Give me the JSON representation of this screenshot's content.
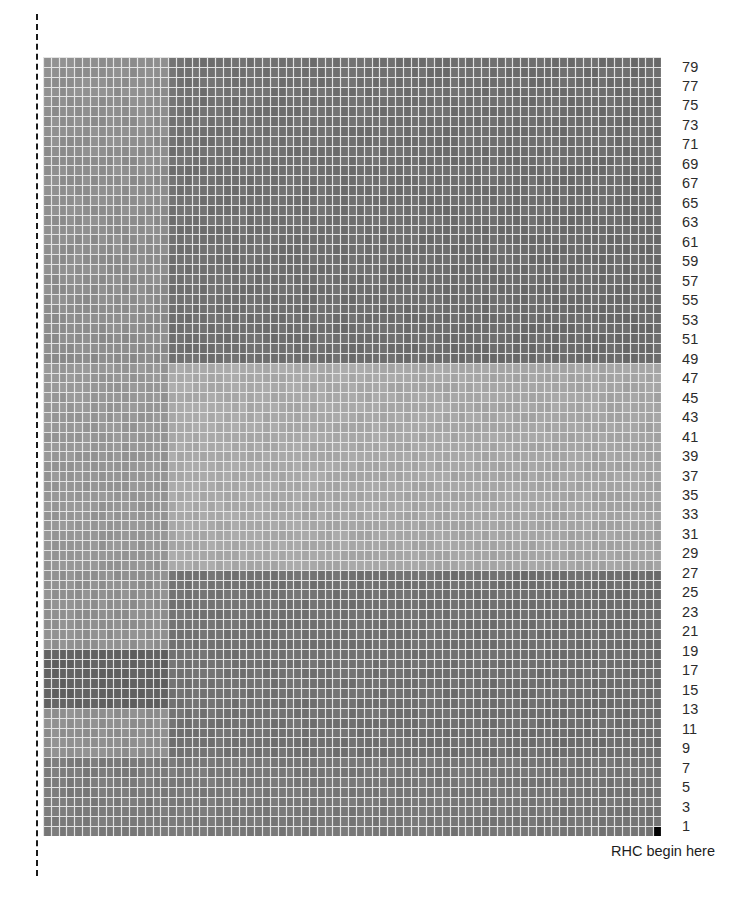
{
  "figure": {
    "title": "",
    "caption_label": "RHC begin here",
    "dashed_guide_name": "left-margin-dashed-line"
  },
  "axis": {
    "position": "right",
    "orientation": "bottom-to-top",
    "tick_labels": [
      "79",
      "77",
      "75",
      "73",
      "71",
      "69",
      "67",
      "65",
      "63",
      "61",
      "59",
      "57",
      "55",
      "53",
      "51",
      "49",
      "47",
      "45",
      "43",
      "41",
      "39",
      "37",
      "35",
      "33",
      "31",
      "29",
      "27",
      "25",
      "23",
      "21",
      "19",
      "17",
      "15",
      "13",
      "11",
      "9",
      "7",
      "5",
      "3",
      "1"
    ]
  },
  "colors": {
    "background": "#ffffff",
    "grid_line": "#e8e8e8",
    "cell_dark": "#4a4a4a",
    "cell_mid": "#565656",
    "cell_light": "#6e6e6e",
    "cell_lightest": "#7a7a7a",
    "cell_black": "#0d0d0d",
    "label_text": "#2b2b2b",
    "dashed_line": "#1a1a1a"
  },
  "chart_data": {
    "type": "heatmap",
    "title": "",
    "xlabel": "",
    "ylabel": "",
    "grid": true,
    "legend": null,
    "rows": 79,
    "cols": 79,
    "row_labels_shown": [
      "79",
      "77",
      "75",
      "73",
      "71",
      "69",
      "67",
      "65",
      "63",
      "61",
      "59",
      "57",
      "55",
      "53",
      "51",
      "49",
      "47",
      "45",
      "43",
      "41",
      "39",
      "37",
      "35",
      "33",
      "31",
      "29",
      "27",
      "25",
      "23",
      "21",
      "19",
      "17",
      "15",
      "13",
      "11",
      "9",
      "7",
      "5",
      "3",
      "1"
    ],
    "col_labels_shown": [],
    "value_range": [
      0.0,
      1.0
    ],
    "colormap": "grayscale",
    "annotations": [
      {
        "text": "RHC begin here",
        "x_frac": 0.97,
        "y_frac": 1.01
      }
    ],
    "regions": [
      {
        "name": "upper-left-block",
        "row_start": 48,
        "row_end": 79,
        "col_start": 0,
        "col_end": 16,
        "value": 0.56
      },
      {
        "name": "upper-right-block",
        "row_start": 48,
        "row_end": 79,
        "col_start": 16,
        "col_end": 79,
        "value": 0.45
      },
      {
        "name": "mid-left-light-patch",
        "row_start": 41,
        "row_end": 48,
        "col_start": 2,
        "col_end": 16,
        "value": 0.72
      },
      {
        "name": "mid-left-band",
        "row_start": 27,
        "row_end": 48,
        "col_start": 0,
        "col_end": 16,
        "value": 0.6
      },
      {
        "name": "center-light-block",
        "row_start": 27,
        "row_end": 48,
        "col_start": 16,
        "col_end": 79,
        "value": 0.68
      },
      {
        "name": "lower-left-block",
        "row_start": 8,
        "row_end": 27,
        "col_start": 0,
        "col_end": 16,
        "value": 0.58
      },
      {
        "name": "lower-dark-patch",
        "row_start": 13,
        "row_end": 19,
        "col_start": 0,
        "col_end": 16,
        "value": 0.4
      },
      {
        "name": "lower-right-block",
        "row_start": 8,
        "row_end": 27,
        "col_start": 16,
        "col_end": 79,
        "value": 0.47
      },
      {
        "name": "bottom-strip",
        "row_start": 0,
        "row_end": 8,
        "col_start": 0,
        "col_end": 79,
        "value": 0.5
      },
      {
        "name": "bottom-right-corner-cell",
        "row_start": 0,
        "row_end": 1,
        "col_start": 78,
        "col_end": 79,
        "value": 0.03
      }
    ]
  }
}
